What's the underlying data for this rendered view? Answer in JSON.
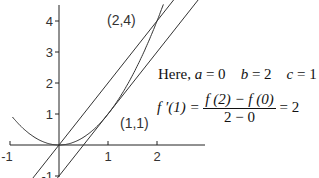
{
  "diagram": {
    "function": "y = x^2",
    "x_ticks": [
      {
        "v": -1,
        "label": "-1"
      },
      {
        "v": 1,
        "label": "1"
      },
      {
        "v": 2,
        "label": "2"
      }
    ],
    "y_ticks": [
      {
        "v": -1,
        "label": "-1"
      },
      {
        "v": 1,
        "label": "1"
      },
      {
        "v": 2,
        "label": "2"
      },
      {
        "v": 3,
        "label": "3"
      },
      {
        "v": 4,
        "label": "4"
      }
    ],
    "xlim": [
      -1,
      3
    ],
    "ylim": [
      -1,
      4.5
    ],
    "lines": [
      {
        "name": "secant-line",
        "slope": 2,
        "intercept": 0
      },
      {
        "name": "tangent-line",
        "slope": 2,
        "intercept": -1
      }
    ],
    "points": [
      {
        "x": 2,
        "y": 4,
        "label": "(2,4)"
      },
      {
        "x": 1,
        "y": 1,
        "label": "(1,1)"
      }
    ]
  },
  "text": {
    "here": "Here,",
    "a_var": "a",
    "a_val": " = 0",
    "b_var": "b",
    "b_val": " = 2",
    "c_var": "c",
    "c_val": " = 1",
    "lhs": "f ′(1) =",
    "numerator": "f (2) − f (0)",
    "denominator": "2 − 0",
    "rhs": "= 2"
  }
}
